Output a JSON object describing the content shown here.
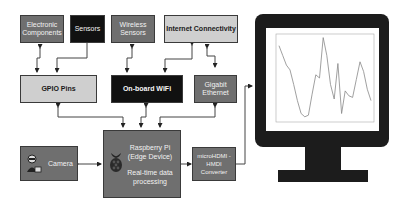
{
  "diagram": {
    "nodes": {
      "electronic_components": "Electronic Components",
      "sensors": "Sensors",
      "wireless_sensors": "Wireless Sensors",
      "internet_connectivity": "Internet Connectivity",
      "gpio_pins": "GPIO Pins",
      "onboard_wifi": "On-board WiFi",
      "gigabit_ethernet": "Gigabit Ethernet",
      "camera": "Camera",
      "raspberry_pi_line1": "Raspberry Pi",
      "raspberry_pi_line2": "(Edge Device)",
      "raspberry_pi_line3": "Real-time data",
      "raspberry_pi_line4": "processing",
      "hdmi_converter": "microHDMI - HMDI Converter"
    },
    "icons": [
      "camera-person-icon",
      "raspberry-pi-logo-icon",
      "monitor-icon"
    ],
    "colors": {
      "mid_gray": "#6f6f6f",
      "dark": "#111111",
      "light_gray": "#cfcfcf",
      "monitor": "#1c1c1c"
    }
  },
  "chart_data": {
    "type": "line",
    "title": "",
    "xlabel": "",
    "ylabel": "",
    "x": [
      0,
      1,
      2,
      3,
      4,
      5,
      6,
      7,
      8,
      9,
      10,
      11,
      12,
      13,
      14,
      15,
      16,
      17,
      18,
      19,
      20,
      21,
      22,
      23,
      24,
      25
    ],
    "values": [
      230,
      200,
      170,
      155,
      110,
      60,
      20,
      10,
      15,
      80,
      140,
      130,
      255,
      200,
      110,
      65,
      175,
      20,
      90,
      75,
      70,
      125,
      180,
      150,
      95,
      60
    ],
    "ylim": [
      0,
      260
    ],
    "grid": false,
    "legend": null
  }
}
